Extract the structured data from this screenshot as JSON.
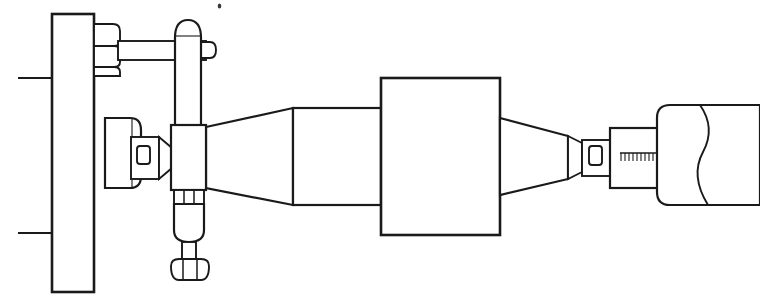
{
  "drawing": {
    "title": "Sectional assembly line drawing",
    "type": "technical-line-drawing",
    "style": "black-and-white engineering outline",
    "canvas": {
      "width": 760,
      "height": 307,
      "background": "#ffffff"
    },
    "line_color": "#1a1a1a",
    "parts": [
      {
        "id": "mounting-wall",
        "label": "Mounting wall plate",
        "shape": "tall vertical rectangle",
        "bounds": {
          "x": 52,
          "y": 14,
          "width": 42,
          "height": 278
        }
      },
      {
        "id": "upper-leader-line",
        "label": "Upper horizontal leader line",
        "shape": "horizontal line",
        "bounds": {
          "x": 18,
          "y": 78,
          "width": 36,
          "height": 0
        }
      },
      {
        "id": "lower-leader-line",
        "label": "Lower horizontal leader line",
        "shape": "horizontal line",
        "bounds": {
          "x": 18,
          "y": 233,
          "width": 36,
          "height": 0
        }
      },
      {
        "id": "hex-nut-top",
        "label": "Upper hexagonal nut",
        "shape": "hexagon profile",
        "bounds": {
          "x": 94,
          "y": 24,
          "width": 26,
          "height": 52
        }
      },
      {
        "id": "tie-rod",
        "label": "Horizontal tie rod",
        "shape": "long rod",
        "bounds": {
          "x": 120,
          "y": 40,
          "width": 86,
          "height": 20
        }
      },
      {
        "id": "vertical-post",
        "label": "Vertical post with domed cap",
        "shape": "rounded-top column",
        "bounds": {
          "x": 175,
          "y": 20,
          "width": 26,
          "height": 108
        }
      },
      {
        "id": "post-side-stub",
        "label": "Post side stub",
        "shape": "small rounded tab",
        "bounds": {
          "x": 201,
          "y": 42,
          "width": 14,
          "height": 16
        }
      },
      {
        "id": "wall-boss",
        "label": "Rounded boss on wall",
        "shape": "rounded rectangle",
        "bounds": {
          "x": 105,
          "y": 118,
          "width": 36,
          "height": 70
        }
      },
      {
        "id": "left-window-connector",
        "label": "Left connector with inspection window",
        "shape": "tapered block with window",
        "bounds": {
          "x": 132,
          "y": 138,
          "width": 40,
          "height": 40
        }
      },
      {
        "id": "left-window",
        "label": "Left inspection window",
        "shape": "rounded rectangle aperture",
        "bounds": {
          "x": 138,
          "y": 147,
          "width": 12,
          "height": 16
        }
      },
      {
        "id": "center-block",
        "label": "Central junction block",
        "shape": "rectangle",
        "bounds": {
          "x": 171,
          "y": 125,
          "width": 35,
          "height": 65
        }
      },
      {
        "id": "segmented-collar",
        "label": "Segmented collar below block",
        "shape": "three-segment band",
        "bounds": {
          "x": 174,
          "y": 190,
          "width": 30,
          "height": 14
        }
      },
      {
        "id": "lower-capsule",
        "label": "Lower rounded capsule body",
        "shape": "rounded rectangle",
        "bounds": {
          "x": 174,
          "y": 204,
          "width": 30,
          "height": 38
        }
      },
      {
        "id": "lower-stem",
        "label": "Lower threaded stem",
        "shape": "short shaft",
        "bounds": {
          "x": 182,
          "y": 242,
          "width": 14,
          "height": 16
        }
      },
      {
        "id": "hex-nut-bottom",
        "label": "Lower hexagonal nut",
        "shape": "hexagon profile",
        "bounds": {
          "x": 172,
          "y": 258,
          "width": 36,
          "height": 22
        }
      },
      {
        "id": "left-taper",
        "label": "Left expanding taper / cone",
        "shape": "truncated cone",
        "bounds": {
          "x": 206,
          "y": 108,
          "width": 87,
          "height": 97
        }
      },
      {
        "id": "mid-cylinder",
        "label": "Intermediate cylinder section",
        "shape": "rectangle",
        "bounds": {
          "x": 293,
          "y": 108,
          "width": 88,
          "height": 97
        }
      },
      {
        "id": "main-body",
        "label": "Main rectangular body",
        "shape": "large rectangle",
        "bounds": {
          "x": 381,
          "y": 78,
          "width": 119,
          "height": 157
        }
      },
      {
        "id": "right-taper",
        "label": "Right converging taper / cone",
        "shape": "truncated cone",
        "bounds": {
          "x": 500,
          "y": 118,
          "width": 68,
          "height": 77
        }
      },
      {
        "id": "right-window-connector",
        "label": "Right connector with inspection window",
        "shape": "tapered block with window",
        "bounds": {
          "x": 568,
          "y": 135,
          "width": 42,
          "height": 45
        }
      },
      {
        "id": "right-window",
        "label": "Right inspection window",
        "shape": "rounded rectangle aperture",
        "bounds": {
          "x": 588,
          "y": 145,
          "width": 13,
          "height": 20
        }
      },
      {
        "id": "scale-sleeve",
        "label": "Graduated sleeve",
        "shape": "rectangle",
        "bounds": {
          "x": 610,
          "y": 128,
          "width": 47,
          "height": 60
        }
      },
      {
        "id": "scale-ruler",
        "label": "Graduation scale with tick marks",
        "shape": "ruler line with ticks",
        "tick_count": 10,
        "bounds": {
          "x": 620,
          "y": 152,
          "width": 36,
          "height": 10
        }
      },
      {
        "id": "right-end-body",
        "label": "Right end cylindrical body",
        "shape": "rounded rectangle with break",
        "bounds": {
          "x": 657,
          "y": 105,
          "width": 103,
          "height": 100
        }
      },
      {
        "id": "break-line",
        "label": "Conventional break line (S-curve)",
        "shape": "double S curve",
        "bounds": {
          "x": 695,
          "y": 105,
          "width": 22,
          "height": 100
        }
      },
      {
        "id": "speck-artifact",
        "label": "Scan speck artifact",
        "shape": "dot",
        "bounds": {
          "x": 218,
          "y": 4,
          "width": 3,
          "height": 4
        }
      }
    ]
  }
}
